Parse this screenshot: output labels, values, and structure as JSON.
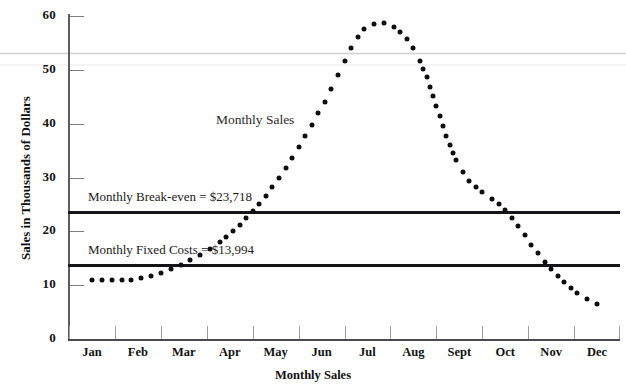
{
  "chart_data": {
    "type": "line",
    "title": "",
    "xlabel": "Monthly Sales",
    "ylabel": "Sales in Thousands of Dollars",
    "grid": false,
    "legend_position": "inline-annotation",
    "marker_style": "dotted",
    "categories": [
      "Jan",
      "Feb",
      "Mar",
      "Apr",
      "May",
      "Jun",
      "Jul",
      "Aug",
      "Sept",
      "Oct",
      "Nov",
      "Dec"
    ],
    "x_tick_labels": [
      "Jan",
      "Feb",
      "Mar",
      "Apr",
      "May",
      "Jun",
      "Jul",
      "Aug",
      "Sept",
      "Oct",
      "Nov",
      "Dec"
    ],
    "y_tick_labels": [
      "0",
      "10",
      "20",
      "30",
      "40",
      "50",
      "60"
    ],
    "y_tick_values": [
      0,
      10,
      20,
      30,
      40,
      50,
      60
    ],
    "ylim": [
      0,
      60
    ],
    "series": [
      {
        "name": "Monthly Sales",
        "values": [
          11.0,
          11.2,
          14.0,
          19.5,
          29.0,
          43.0,
          58.0,
          54.0,
          32.0,
          24.0,
          13.0,
          6.5
        ]
      }
    ],
    "reference_lines": [
      {
        "name": "Monthly Break-even",
        "label": "Monthly Break-even = $23,718",
        "value": 23.718,
        "color": "#14141a"
      },
      {
        "name": "Monthly Fixed Costs",
        "label": "Monthly Fixed Costs = $13,994",
        "value": 13.994,
        "color": "#14141a"
      }
    ],
    "annotations": [
      {
        "name": "series-label",
        "text": "Monthly Sales",
        "x": 4.0,
        "y": 40.5
      }
    ]
  },
  "axes": {
    "y_title": "Sales in Thousands of Dollars",
    "x_title": "Monthly Sales"
  },
  "colors": {
    "axis": "#5c5c62",
    "marker": "#0d0d12",
    "reference_line": "#14141a",
    "text": "#111111",
    "background": "#ffffff"
  }
}
